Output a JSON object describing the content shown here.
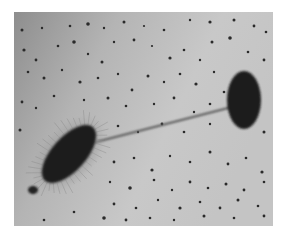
{
  "image": {
    "subject": "electron micrograph of bacterial conjugation",
    "frame": {
      "x": 14,
      "y": 12,
      "width": 259,
      "height": 214
    },
    "colors": {
      "page_background": "#ffffff",
      "photo_dark": "#8e8e8e",
      "photo_light": "#c9c9c9",
      "cell": "#1e1e1e",
      "pilus": "#5a5a5a",
      "speck": "#2a2a2a"
    },
    "donor_cell": {
      "cx": 55,
      "cy": 142,
      "rx": 36,
      "ry": 17,
      "rotation": -48,
      "label": ""
    },
    "recipient_cell": {
      "cx": 230,
      "cy": 88,
      "rx": 17,
      "ry": 29,
      "rotation": 0,
      "label": ""
    },
    "sex_pilus": {
      "x1": 82,
      "y1": 130,
      "x2": 218,
      "y2": 95
    },
    "small_body": {
      "cx": 19,
      "cy": 178,
      "rx": 5,
      "ry": 4
    },
    "specks": [
      [
        8,
        18,
        1.5
      ],
      [
        28,
        16,
        1.2
      ],
      [
        56,
        14,
        1.3
      ],
      [
        74,
        12,
        1.8
      ],
      [
        90,
        16,
        1.2
      ],
      [
        110,
        10,
        1.5
      ],
      [
        130,
        14,
        1.1
      ],
      [
        150,
        18,
        1.3
      ],
      [
        176,
        8,
        1.2
      ],
      [
        196,
        10,
        1.6
      ],
      [
        220,
        8,
        1.5
      ],
      [
        240,
        14,
        1.4
      ],
      [
        252,
        20,
        1.3
      ],
      [
        10,
        38,
        1.6
      ],
      [
        22,
        48,
        1.4
      ],
      [
        44,
        34,
        1.3
      ],
      [
        60,
        30,
        1.8
      ],
      [
        74,
        42,
        1.2
      ],
      [
        88,
        50,
        1.5
      ],
      [
        100,
        30,
        1.2
      ],
      [
        120,
        28,
        1.4
      ],
      [
        138,
        34,
        1.1
      ],
      [
        156,
        46,
        1.6
      ],
      [
        170,
        38,
        1.3
      ],
      [
        186,
        48,
        1.2
      ],
      [
        198,
        30,
        1.5
      ],
      [
        216,
        26,
        1.8
      ],
      [
        234,
        40,
        1.3
      ],
      [
        250,
        48,
        1.4
      ],
      [
        14,
        60,
        1.3
      ],
      [
        30,
        66,
        1.5
      ],
      [
        48,
        58,
        1.2
      ],
      [
        66,
        70,
        1.6
      ],
      [
        84,
        66,
        1.3
      ],
      [
        104,
        62,
        1.2
      ],
      [
        118,
        78,
        1.4
      ],
      [
        134,
        64,
        1.5
      ],
      [
        150,
        70,
        1.2
      ],
      [
        166,
        62,
        1.3
      ],
      [
        182,
        72,
        1.6
      ],
      [
        200,
        60,
        1.2
      ],
      [
        210,
        80,
        1.3
      ],
      [
        8,
        90,
        1.4
      ],
      [
        22,
        96,
        1.2
      ],
      [
        40,
        84,
        1.3
      ],
      [
        70,
        88,
        1.2
      ],
      [
        94,
        86,
        1.5
      ],
      [
        112,
        94,
        1.3
      ],
      [
        140,
        92,
        1.2
      ],
      [
        160,
        86,
        1.4
      ],
      [
        180,
        100,
        1.2
      ],
      [
        196,
        92,
        1.3
      ],
      [
        6,
        118,
        1.5
      ],
      [
        104,
        114,
        1.3
      ],
      [
        124,
        120,
        1.2
      ],
      [
        148,
        112,
        1.4
      ],
      [
        170,
        120,
        1.3
      ],
      [
        196,
        112,
        1.2
      ],
      [
        250,
        120,
        1.5
      ],
      [
        100,
        150,
        1.4
      ],
      [
        120,
        146,
        1.3
      ],
      [
        138,
        158,
        1.6
      ],
      [
        156,
        144,
        1.2
      ],
      [
        176,
        150,
        1.3
      ],
      [
        196,
        140,
        1.5
      ],
      [
        214,
        152,
        1.4
      ],
      [
        232,
        146,
        1.3
      ],
      [
        248,
        160,
        1.6
      ],
      [
        96,
        170,
        1.2
      ],
      [
        116,
        176,
        1.8
      ],
      [
        140,
        168,
        1.3
      ],
      [
        158,
        178,
        1.2
      ],
      [
        176,
        170,
        1.4
      ],
      [
        194,
        176,
        1.3
      ],
      [
        212,
        172,
        1.5
      ],
      [
        230,
        178,
        1.4
      ],
      [
        250,
        170,
        1.3
      ],
      [
        100,
        192,
        1.4
      ],
      [
        122,
        196,
        1.3
      ],
      [
        144,
        188,
        1.2
      ],
      [
        166,
        196,
        1.6
      ],
      [
        186,
        190,
        1.3
      ],
      [
        206,
        196,
        1.4
      ],
      [
        224,
        188,
        1.5
      ],
      [
        244,
        194,
        1.3
      ],
      [
        60,
        200,
        1.3
      ],
      [
        90,
        206,
        1.8
      ],
      [
        112,
        208,
        1.4
      ],
      [
        136,
        206,
        1.3
      ],
      [
        160,
        208,
        1.2
      ],
      [
        190,
        204,
        1.5
      ],
      [
        220,
        206,
        1.3
      ],
      [
        250,
        204,
        1.4
      ],
      [
        30,
        208,
        1.3
      ]
    ]
  }
}
